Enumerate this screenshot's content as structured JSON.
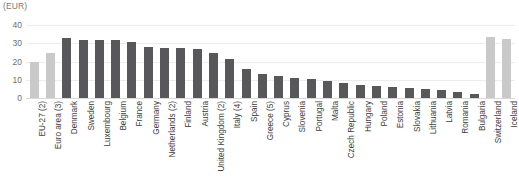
{
  "units_label": "(EUR)",
  "chart_data": {
    "type": "bar",
    "title": "",
    "subtitle": "",
    "xlabel": "",
    "ylabel": "(EUR)",
    "ylim": [
      0,
      40
    ],
    "yticks": [
      0,
      10,
      20,
      30,
      40
    ],
    "grid": true,
    "legend": false,
    "categories": [
      "EU-27 (2)",
      "Euro area (3)",
      "Denmark",
      "Sweden",
      "Luxembourg",
      "Belgium",
      "France",
      "Germany",
      "Netherlands (2)",
      "Finland",
      "Austria",
      "United Kingdom (2)",
      "Italy (4)",
      "Spain",
      "Greece (5)",
      "Cyprus",
      "Slovenia",
      "Portugal",
      "Malta",
      "Czech Republic",
      "Hungary",
      "Poland",
      "Estonia",
      "Slovakia",
      "Lithuania",
      "Latvia",
      "Romania",
      "Bulgaria",
      "Switzerland",
      "Iceland"
    ],
    "values": [
      20.0,
      24.5,
      33.0,
      32.0,
      32.0,
      31.8,
      30.5,
      28.0,
      27.5,
      27.5,
      26.8,
      24.5,
      21.5,
      15.8,
      13.3,
      12.0,
      11.0,
      10.5,
      9.5,
      8.0,
      7.3,
      6.5,
      5.8,
      5.3,
      4.8,
      4.3,
      3.3,
      2.2,
      33.5,
      32.5
    ],
    "series_groups": [
      "aggregate",
      "aggregate",
      "member",
      "member",
      "member",
      "member",
      "member",
      "member",
      "member",
      "member",
      "member",
      "member",
      "member",
      "member",
      "member",
      "member",
      "member",
      "member",
      "member",
      "member",
      "member",
      "member",
      "member",
      "member",
      "member",
      "member",
      "member",
      "member",
      "nonmember",
      "nonmember"
    ]
  },
  "colors": {
    "bar_dark": "#58585a",
    "bar_light": "#c9c9c9",
    "gridline": "#ececec",
    "baseline": "#d9d9d9",
    "tick_text": "#6e6e6e",
    "label_text": "#3d3d3d",
    "caption_text": "#7a7a7a",
    "background": "#ffffff"
  }
}
